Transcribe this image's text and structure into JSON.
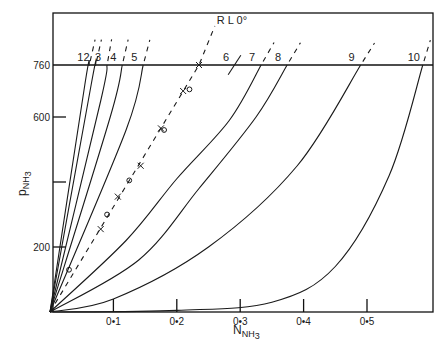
{
  "chart_data": {
    "type": "line",
    "title": "",
    "xlabel": "N_NH3",
    "ylabel": "p_NH3",
    "xlim": [
      0,
      0.6
    ],
    "ylim": [
      0,
      920
    ],
    "x_ticks": [
      {
        "value": 0.1,
        "label": "0.1"
      },
      {
        "value": 0.2,
        "label": "0.2"
      },
      {
        "value": 0.3,
        "label": "0.3"
      },
      {
        "value": 0.4,
        "label": "0.4"
      },
      {
        "value": 0.5,
        "label": "0.5"
      }
    ],
    "y_ticks": [
      {
        "value": 200,
        "label": "200"
      },
      {
        "value": 400,
        "label": ""
      },
      {
        "value": 600,
        "label": "600"
      },
      {
        "value": 760,
        "label": "760"
      }
    ],
    "reference_line": {
      "value": 760,
      "label": "760"
    },
    "dashed_line": {
      "label": "R L 0°",
      "x": [
        0,
        0.235,
        0.26
      ],
      "y": [
        0,
        760,
        880
      ]
    },
    "markers": {
      "x_marks": [
        [
          0.235,
          760
        ],
        [
          0.21,
          680
        ],
        [
          0.175,
          565
        ],
        [
          0.143,
          450
        ],
        [
          0.107,
          355
        ],
        [
          0.08,
          255
        ]
      ],
      "o_marks": [
        [
          0.22,
          685
        ],
        [
          0.18,
          560
        ],
        [
          0.125,
          405
        ],
        [
          0.09,
          300
        ],
        [
          0.03,
          130
        ]
      ]
    },
    "series": [
      {
        "name": "1",
        "x": [
          0,
          0.055,
          0.062
        ],
        "y": [
          0,
          700,
          760
        ]
      },
      {
        "name": "2",
        "x": [
          0,
          0.065,
          0.072
        ],
        "y": [
          0,
          700,
          760
        ]
      },
      {
        "name": "3",
        "x": [
          0,
          0.08,
          0.09
        ],
        "y": [
          0,
          650,
          760
        ]
      },
      {
        "name": "4",
        "x": [
          0,
          0.095,
          0.114
        ],
        "y": [
          0,
          600,
          760
        ]
      },
      {
        "name": "5",
        "x": [
          0,
          0.12,
          0.147
        ],
        "y": [
          0,
          560,
          760
        ]
      },
      {
        "name": "6",
        "x": [
          0.281,
          0.301
        ],
        "y": [
          730,
          790
        ]
      },
      {
        "name": "7",
        "x": [
          0,
          0.12,
          0.2,
          0.283,
          0.333
        ],
        "y": [
          0,
          220,
          410,
          590,
          760
        ]
      },
      {
        "name": "8",
        "x": [
          0,
          0.14,
          0.235,
          0.325,
          0.374
        ],
        "y": [
          0,
          160,
          380,
          600,
          760
        ]
      },
      {
        "name": "9",
        "x": [
          0,
          0.1,
          0.25,
          0.39,
          0.49
        ],
        "y": [
          0,
          40,
          200,
          450,
          760
        ]
      },
      {
        "name": "10",
        "x": [
          0,
          0.2,
          0.35,
          0.45,
          0.535,
          0.588
        ],
        "y": [
          0,
          5,
          30,
          140,
          420,
          760
        ]
      }
    ],
    "grid": false,
    "legend": "inline labels above 760 line"
  }
}
